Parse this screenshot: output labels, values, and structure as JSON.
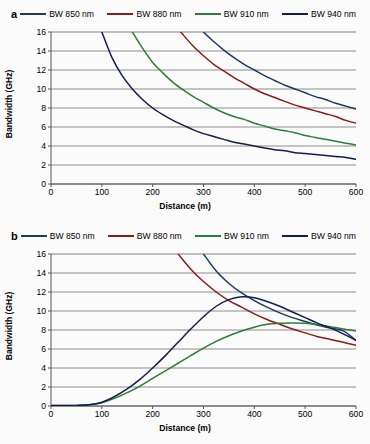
{
  "figure": {
    "background": "#fbfbfb",
    "panels": [
      "a",
      "b"
    ]
  },
  "panel_a": {
    "letter": "a",
    "legend": [
      {
        "label": "BW 850 nm",
        "color": "#1f3864"
      },
      {
        "label": "BW 880 nm",
        "color": "#8b1a1a"
      },
      {
        "label": "BW 910 nm",
        "color": "#2e7d32"
      },
      {
        "label": "BW 940 nm",
        "color": "#141d4e"
      }
    ]
  },
  "panel_b": {
    "letter": "b",
    "legend": [
      {
        "label": "BW 850 nm",
        "color": "#1f3864"
      },
      {
        "label": "BW 880 nm",
        "color": "#8b1a1a"
      },
      {
        "label": "BW 910 nm",
        "color": "#2e7d32"
      },
      {
        "label": "BW 940 nm",
        "color": "#141d4e"
      }
    ]
  },
  "chart_data": [
    {
      "panel": "a",
      "type": "line",
      "title": "",
      "xlabel": "Distance (m)",
      "ylabel": "Bandwidth (GHz)",
      "xlim": [
        0,
        600
      ],
      "ylim": [
        0,
        16
      ],
      "xticks": [
        0,
        100,
        200,
        300,
        400,
        500,
        600
      ],
      "yticks": [
        0,
        2,
        4,
        6,
        8,
        10,
        12,
        14,
        16
      ],
      "grid": "horizontal",
      "legend_position": "top",
      "x": [
        100,
        120,
        140,
        160,
        180,
        200,
        220,
        240,
        260,
        280,
        300,
        320,
        340,
        360,
        380,
        400,
        420,
        440,
        460,
        480,
        500,
        520,
        540,
        560,
        580,
        600
      ],
      "series": [
        {
          "name": "BW 850 nm",
          "color": "#1f3864",
          "values": [
            null,
            null,
            null,
            null,
            null,
            null,
            null,
            null,
            null,
            17.3,
            16.0,
            15.0,
            14.1,
            13.3,
            12.6,
            12.0,
            11.4,
            10.9,
            10.4,
            10.0,
            9.6,
            9.2,
            8.9,
            8.5,
            8.2,
            7.9
          ]
        },
        {
          "name": "BW 880 nm",
          "color": "#8b1a1a",
          "values": [
            null,
            null,
            null,
            null,
            null,
            null,
            null,
            17.0,
            15.7,
            14.5,
            13.5,
            12.6,
            11.9,
            11.2,
            10.6,
            10.0,
            9.5,
            9.1,
            8.7,
            8.3,
            8.0,
            7.7,
            7.4,
            7.1,
            6.7,
            6.4
          ]
        },
        {
          "name": "BW 910 nm",
          "color": "#2e7d32",
          "values": [
            null,
            null,
            null,
            16.0,
            14.3,
            12.8,
            11.7,
            10.7,
            9.9,
            9.2,
            8.6,
            8.0,
            7.5,
            7.1,
            6.8,
            6.4,
            6.1,
            5.8,
            5.6,
            5.4,
            5.1,
            4.9,
            4.7,
            4.5,
            4.3,
            4.1
          ]
        },
        {
          "name": "BW 940 nm",
          "color": "#141d4e",
          "values": [
            16.0,
            13.3,
            11.4,
            10.0,
            8.9,
            8.0,
            7.3,
            6.7,
            6.2,
            5.7,
            5.3,
            5.0,
            4.7,
            4.4,
            4.2,
            4.0,
            3.8,
            3.6,
            3.5,
            3.3,
            3.2,
            3.1,
            3.0,
            2.9,
            2.8,
            2.6
          ]
        }
      ]
    },
    {
      "panel": "b",
      "type": "line",
      "title": "",
      "xlabel": "Distance (m)",
      "ylabel": "Bandwidth (GHz)",
      "xlim": [
        0,
        600
      ],
      "ylim": [
        0,
        16
      ],
      "xticks": [
        0,
        100,
        200,
        300,
        400,
        500,
        600
      ],
      "yticks": [
        0,
        2,
        4,
        6,
        8,
        10,
        12,
        14,
        16
      ],
      "grid": "horizontal",
      "legend_position": "top",
      "x": [
        0,
        25,
        50,
        75,
        100,
        125,
        150,
        175,
        200,
        225,
        250,
        275,
        300,
        325,
        350,
        375,
        400,
        425,
        450,
        475,
        500,
        525,
        550,
        575,
        600
      ],
      "series": [
        {
          "name": "BW 850 nm",
          "color": "#1f3864",
          "values": [
            null,
            null,
            null,
            null,
            null,
            null,
            null,
            null,
            null,
            null,
            null,
            null,
            16.0,
            14.2,
            12.9,
            11.9,
            11.1,
            10.4,
            9.8,
            9.3,
            8.9,
            8.5,
            8.2,
            7.9,
            6.9
          ]
        },
        {
          "name": "BW 880 nm",
          "color": "#8b1a1a",
          "values": [
            null,
            null,
            null,
            null,
            null,
            null,
            null,
            null,
            null,
            null,
            16.0,
            14.4,
            13.1,
            12.0,
            11.1,
            10.4,
            9.7,
            9.1,
            8.6,
            8.1,
            7.7,
            7.3,
            7.0,
            6.7,
            6.4
          ]
        },
        {
          "name": "BW 910 nm",
          "color": "#2e7d32",
          "values": [
            0.05,
            0.05,
            0.06,
            0.12,
            0.35,
            0.8,
            1.4,
            2.1,
            2.9,
            3.7,
            4.5,
            5.3,
            6.1,
            6.8,
            7.4,
            7.9,
            8.3,
            8.6,
            8.7,
            8.75,
            8.7,
            8.55,
            8.35,
            8.1,
            7.9
          ]
        },
        {
          "name": "BW 940 nm",
          "color": "#141d4e",
          "values": [
            0.05,
            0.05,
            0.06,
            0.12,
            0.4,
            1.0,
            1.8,
            2.8,
            4.0,
            5.3,
            6.7,
            8.1,
            9.4,
            10.5,
            11.2,
            11.5,
            11.4,
            11.0,
            10.5,
            9.9,
            9.3,
            8.7,
            8.2,
            7.6,
            6.9
          ]
        }
      ]
    }
  ]
}
